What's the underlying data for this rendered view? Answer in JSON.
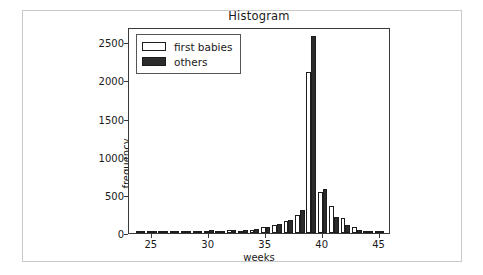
{
  "chart_data": {
    "type": "bar",
    "title": "Histogram",
    "xlabel": "weeks",
    "ylabel": "frequency",
    "grid": false,
    "legend_position": "upper left",
    "xlim": [
      23,
      46
    ],
    "ylim": [
      0,
      2700
    ],
    "xticks": [
      25,
      30,
      35,
      40,
      45
    ],
    "yticks": [
      0,
      500,
      1000,
      1500,
      2000,
      2500
    ],
    "categories": [
      24,
      25,
      26,
      27,
      28,
      29,
      30,
      31,
      32,
      33,
      34,
      35,
      36,
      37,
      38,
      39,
      40,
      41,
      42,
      43,
      44,
      45
    ],
    "series": [
      {
        "name": "first babies",
        "color": "#ffffff",
        "edge_color": "#1c1c1c",
        "values": [
          4,
          5,
          3,
          3,
          8,
          12,
          23,
          22,
          35,
          25,
          41,
          78,
          109,
          158,
          232,
          2114,
          532,
          360,
          196,
          83,
          22,
          6
        ]
      },
      {
        "name": "others",
        "color": "#2b2b2b",
        "edge_color": "#1c1c1c",
        "values": [
          6,
          11,
          5,
          5,
          12,
          17,
          46,
          20,
          40,
          36,
          47,
          80,
          114,
          175,
          301,
          2579,
          580,
          215,
          111,
          42,
          12,
          4
        ]
      }
    ],
    "annotations": []
  },
  "figure": {
    "background": "#ffffff",
    "border_color": "#c9c9c9",
    "axes_edge_color": "#3a3a3a"
  },
  "legend": {
    "items": [
      {
        "label": "first babies",
        "swatch": "first"
      },
      {
        "label": "others",
        "swatch": "others"
      }
    ]
  }
}
